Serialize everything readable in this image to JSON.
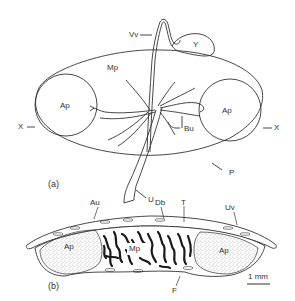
{
  "figure": {
    "panel_a": {
      "label": "(a)",
      "labels": {
        "vv": "Vv",
        "y": "Y",
        "mp": "Mp",
        "ap_left": "Ap",
        "ap_right": "Ap",
        "x_left": "X",
        "x_right": "X",
        "bu": "Bu",
        "u": "U",
        "p": "P"
      }
    },
    "panel_b": {
      "label": "(b)",
      "labels": {
        "au": "Au",
        "db": "Db",
        "t": "T",
        "uv": "Uv",
        "ap_left": "Ap",
        "mp": "Mp",
        "ap_right": "Ap",
        "f": "F"
      },
      "scale_bar": "1 mm"
    },
    "colors": {
      "line": "#333333",
      "stipple": "#555555",
      "dense": "#1a1a1a",
      "background": "#ffffff"
    }
  }
}
